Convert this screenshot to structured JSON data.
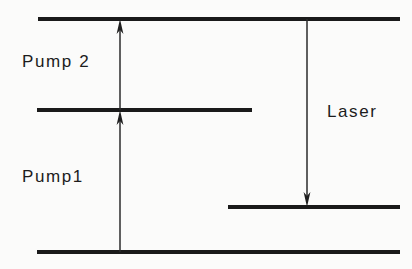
{
  "figure": {
    "kind": "energy-level-diagram",
    "background_color": "#fbfbfa",
    "stroke_color": "#1a1a1a"
  },
  "labels": {
    "pump2": "Pump 2",
    "pump1": "Pump1",
    "laser": "Laser"
  },
  "chart_data": {
    "type": "diagram",
    "title": "",
    "xlabel": "",
    "ylabel": "",
    "levels": [
      {
        "name": "upper-laser-level",
        "y": 19,
        "x_start": 38,
        "x_end": 400
      },
      {
        "name": "intermediate-level",
        "y": 110,
        "x_start": 37,
        "x_end": 252
      },
      {
        "name": "lower-laser-level",
        "y": 207,
        "x_start": 228,
        "x_end": 400
      },
      {
        "name": "ground-level",
        "y": 252,
        "x_start": 37,
        "x_end": 400
      }
    ],
    "transitions": [
      {
        "name": "Pump 2",
        "x": 120,
        "y_from": 110,
        "y_to": 19,
        "direction": "up"
      },
      {
        "name": "Pump1",
        "x": 120,
        "y_from": 252,
        "y_to": 110,
        "direction": "up"
      },
      {
        "name": "Laser",
        "x": 307,
        "y_from": 19,
        "y_to": 207,
        "direction": "down"
      }
    ]
  }
}
